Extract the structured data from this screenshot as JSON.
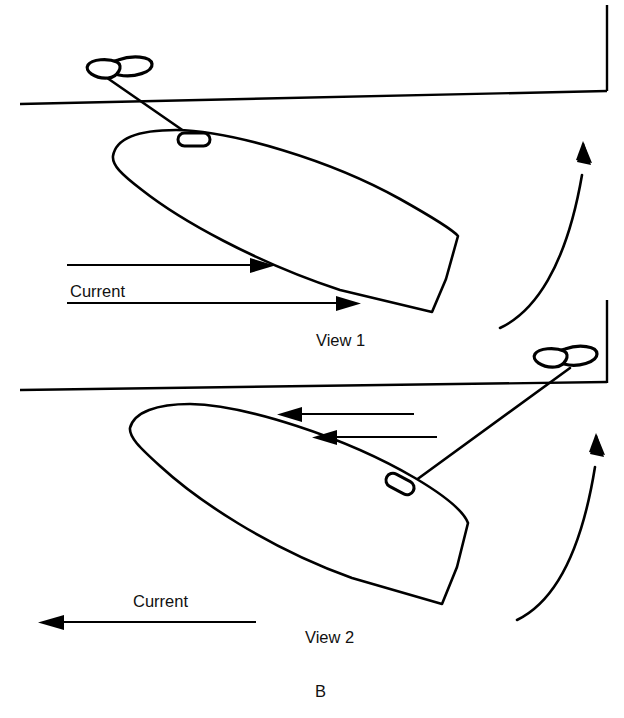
{
  "figure": {
    "caption": "B",
    "background_color": "#ffffff",
    "ink_color": "#000000",
    "width": 624,
    "height": 718
  },
  "views": [
    {
      "id": "view-1",
      "label": "View 1",
      "label_x": 316,
      "label_y": 346,
      "current_label": "Current",
      "current_label_x": 70,
      "current_label_y": 297,
      "current_direction": "right",
      "current_arrow_count": 2,
      "boat_orientation": "bow-up-left-stern-down-right",
      "mooring": "bow cleat tied to buoy above dock line",
      "swing_arrow_direction": "up",
      "description": "Vessel lying to current with bow line to mooring buoy; current flows toward the pier"
    },
    {
      "id": "view-2",
      "label": "View 2",
      "label_x": 305,
      "label_y": 643,
      "current_label": "Current",
      "current_label_x": 133,
      "current_label_y": 607,
      "current_direction": "left",
      "current_arrow_count": 1,
      "boat_arrow_count": 2,
      "boat_arrow_direction": "left",
      "boat_orientation": "bow-up-left-stern-down-right",
      "mooring": "stern-quarter cleat tied to buoy at pier corner",
      "swing_arrow_direction": "up",
      "description": "Vessel swung by reversed current; line leads aft to the buoy at the pier"
    }
  ],
  "elements": {
    "dock_line_top": "pier edge line upper",
    "dock_wall_top": "pier face vertical upper",
    "dock_line_bottom": "pier edge line lower",
    "dock_wall_bottom": "pier face vertical lower",
    "buoy_top": "mooring-buoy",
    "buoy_bottom": "mooring-buoy",
    "cleat_top": "deck-cleat",
    "cleat_bottom": "deck-cleat",
    "hull_top": "boat-hull",
    "hull_bottom": "boat-hull",
    "swing_arrow_top": "swing-direction-arrow",
    "swing_arrow_bottom": "swing-direction-arrow"
  }
}
